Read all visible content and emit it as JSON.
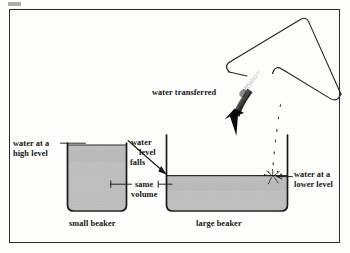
{
  "figure": {
    "background_color": "#fdfdfc",
    "frame_color": "#2b2b2b",
    "water_fill_color": "#b9b9b9",
    "ink_color": "#141414"
  },
  "labels": {
    "water_high_level_line1": "water at a",
    "water_high_level_line2": "high level",
    "water_level_falls_line1": "water",
    "water_level_falls_line2": "level",
    "water_level_falls_line3": "falls",
    "same_volume_line1": "same",
    "same_volume_line2": "volume",
    "water_transferred": "water transferred",
    "water_lower_level_line1": "water at a",
    "water_lower_level_line2": "lower level",
    "small_beaker": "small beaker",
    "large_beaker": "large beaker"
  },
  "objects": {
    "small_beaker": {
      "name": "small beaker",
      "left": 67,
      "right": 127,
      "top": 143,
      "bottom": 211,
      "water_top": 145,
      "filled": true
    },
    "large_beaker": {
      "name": "large beaker",
      "left": 166,
      "right": 288,
      "top": 135,
      "bottom": 211,
      "water_top": 176,
      "filled": true
    },
    "pouring_beaker": {
      "name": "tilted pouring beaker",
      "rotation_degrees": -41,
      "empty": true
    },
    "transfer_arrow": {
      "name": "thick downward transfer arrow",
      "tip_x": 233,
      "tip_y": 136
    },
    "level_falls_arrow": {
      "name": "thin arrow from small beaker rim to large beaker water level",
      "from_x": 128,
      "from_y": 141,
      "to_x": 167,
      "to_y": 175
    },
    "water_stream": {
      "name": "falling water droplets",
      "from_x": 281,
      "from_y": 104,
      "to_x": 272,
      "to_y": 176
    }
  },
  "icon_names": [
    "beaker-icon",
    "water-fill-icon",
    "transfer-arrow-icon",
    "droplet-icon",
    "splash-icon",
    "leader-line-icon"
  ]
}
